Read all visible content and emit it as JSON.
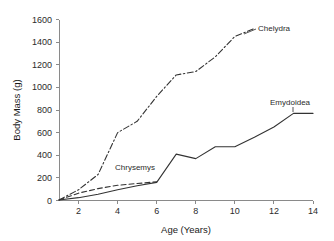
{
  "chart_data": {
    "type": "line",
    "title": "",
    "xlabel": "Age (Years)",
    "ylabel": "Body Mass (g)",
    "xlim": [
      1,
      14
    ],
    "ylim": [
      0,
      1600
    ],
    "xticks": [
      2,
      4,
      6,
      8,
      10,
      12,
      14
    ],
    "yticks": [
      0,
      200,
      400,
      600,
      800,
      1000,
      1200,
      1400,
      1600
    ],
    "grid": false,
    "legend": "inline-annotations",
    "series": [
      {
        "name": "Chelydra",
        "style": "dash-dot",
        "x": [
          1,
          2,
          3,
          4,
          5,
          6,
          7,
          8,
          9,
          10,
          11
        ],
        "values": [
          5,
          95,
          230,
          600,
          700,
          920,
          1110,
          1140,
          1270,
          1450,
          1520
        ]
      },
      {
        "name": "Emydoidea",
        "style": "solid",
        "x": [
          1,
          2,
          3,
          4,
          5,
          6,
          7,
          8,
          9,
          10,
          11,
          12,
          13,
          14
        ],
        "values": [
          5,
          25,
          55,
          95,
          130,
          160,
          410,
          370,
          475,
          475,
          560,
          650,
          770,
          770
        ]
      },
      {
        "name": "Chrysemys",
        "style": "dashed",
        "x": [
          1,
          2,
          3,
          4,
          5,
          6
        ],
        "values": [
          5,
          65,
          105,
          135,
          150,
          165
        ]
      }
    ],
    "annotations": [
      {
        "text": "Chelydra",
        "x": 11.7,
        "y": 1540
      },
      {
        "text": "Emydoidea",
        "x": 12.3,
        "y": 870
      },
      {
        "text": "Chrysemys",
        "x": 5.0,
        "y": 300
      }
    ]
  },
  "axis": {
    "y_tick_labels": [
      "1600",
      "1400",
      "1200",
      "1000",
      "800",
      "600",
      "400",
      "200",
      "0"
    ],
    "x_tick_labels": [
      "2",
      "4",
      "6",
      "8",
      "10",
      "12",
      "14"
    ],
    "y_title": "Body Mass (g)",
    "x_title": "Age (Years)"
  },
  "labels": {
    "chelydra": "Chelydra",
    "emydoidea": "Emydoidea",
    "chrysemys": "Chrysemys"
  },
  "colors": {
    "background": "#ffffff",
    "axis": "#8a8a8a",
    "line": "#333333",
    "text": "#2b2b2b"
  }
}
